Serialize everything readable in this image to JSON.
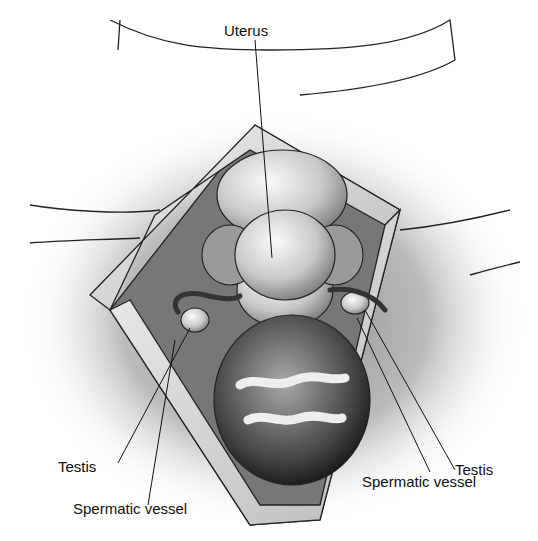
{
  "figure": {
    "labels": {
      "uterus": "Uterus",
      "testis_left": "Testis",
      "testis_right": "Testis",
      "spermatic_vessel_left": "Spermatic vessel",
      "spermatic_vessel_right": "Spermatic vessel"
    }
  }
}
